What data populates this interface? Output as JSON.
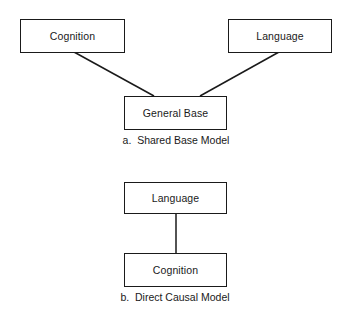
{
  "diagram_a": {
    "nodes": {
      "cognition": "Cognition",
      "language": "Language",
      "general_base": "General Base"
    },
    "edges": [
      {
        "from": "cognition",
        "to": "general_base"
      },
      {
        "from": "language",
        "to": "general_base"
      }
    ],
    "caption": "a.  Shared Base Model"
  },
  "diagram_b": {
    "nodes": {
      "language": "Language",
      "cognition": "Cognition"
    },
    "edges": [
      {
        "from": "language",
        "to": "cognition"
      }
    ],
    "caption": "b.  Direct Causal Model"
  },
  "colors": {
    "line": "#1a1a1a",
    "background": "#ffffff"
  }
}
